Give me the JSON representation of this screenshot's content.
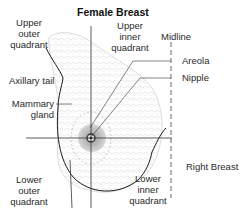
{
  "title": "Female Breast",
  "side_label": "Right Breast",
  "labels": {
    "upper_outer": [
      "Upper",
      "outer",
      "quadrant"
    ],
    "upper_inner": [
      "Upper",
      "inner",
      "quadrant"
    ],
    "lower_outer": [
      "Lower",
      "outer",
      "quadrant"
    ],
    "lower_inner": [
      "Lower",
      "inner",
      "quadrant"
    ],
    "midline": "Midline",
    "axillary_tail": "Axillary tail",
    "mammary_gland": [
      "Mammary",
      "gland"
    ],
    "areola": "Areola",
    "nipple": "Nipple"
  },
  "colors": {
    "outline": "#1a1a1a",
    "tissue": "#d9d9d9",
    "areola": "#b5b5b5",
    "nipple": "#555555",
    "axis": "#333333"
  }
}
